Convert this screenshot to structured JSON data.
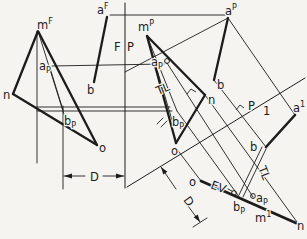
{
  "figure": {
    "background_color": "#f5f4f0",
    "ink_color": "#1c1c1c",
    "labels": [
      {
        "name": "label-a-F",
        "base": "a",
        "sup": "F",
        "x": 97,
        "y": 14,
        "rot": 0
      },
      {
        "name": "label-m-F",
        "base": "m",
        "sup": "F",
        "x": 37,
        "y": 29,
        "rot": 0
      },
      {
        "name": "label-n-front",
        "base": "n",
        "x": 3,
        "y": 99,
        "rot": 0
      },
      {
        "name": "label-a-P-front",
        "base": "a",
        "sub": "P",
        "x": 39,
        "y": 70,
        "rot": 0
      },
      {
        "name": "label-b-front",
        "base": "b",
        "x": 87,
        "y": 94,
        "rot": 0
      },
      {
        "name": "label-b-P-front",
        "base": "b",
        "sub": "P",
        "x": 64,
        "y": 125,
        "rot": 0
      },
      {
        "name": "label-o-front",
        "base": "o",
        "x": 99,
        "y": 152,
        "rot": 0
      },
      {
        "name": "label-D-front",
        "base": "D",
        "x": 90,
        "y": 181,
        "rot": 0
      },
      {
        "name": "label-fold-F",
        "base": "F",
        "x": 114,
        "y": 51,
        "rot": 0
      },
      {
        "name": "label-fold-P",
        "base": "P",
        "x": 127,
        "y": 51,
        "rot": 0
      },
      {
        "name": "label-m-P",
        "base": "m",
        "sup": "P",
        "x": 138,
        "y": 31,
        "rot": 0
      },
      {
        "name": "label-a-P-top",
        "base": "a",
        "sup": "P",
        "x": 225,
        "y": 15,
        "rot": 0
      },
      {
        "name": "label-b-profile",
        "base": "b",
        "x": 217,
        "y": 89,
        "rot": 0
      },
      {
        "name": "label-n-profile",
        "base": "n",
        "x": 208,
        "y": 104,
        "rot": 0
      },
      {
        "name": "label-o-profile",
        "base": "o",
        "x": 171,
        "y": 155,
        "rot": 0
      },
      {
        "name": "label-b-P-profile",
        "base": "b",
        "sub": "P",
        "x": 172,
        "y": 126,
        "rot": 0
      },
      {
        "name": "label-a-P-profile",
        "base": "a",
        "sub": "P",
        "x": 151,
        "y": 66,
        "rot": 0
      },
      {
        "name": "label-TL-profile",
        "base": "TL",
        "x": 158,
        "y": 95,
        "rot": -22
      },
      {
        "name": "label-fold-P2",
        "base": "P",
        "x": 248,
        "y": 110,
        "rot": 0
      },
      {
        "name": "label-fold-1",
        "base": "1",
        "x": 263,
        "y": 115,
        "rot": 0
      },
      {
        "name": "label-a-1",
        "base": "a",
        "sup": "1",
        "x": 293,
        "y": 112,
        "rot": 0
      },
      {
        "name": "label-b-aux",
        "base": "b",
        "x": 250,
        "y": 151,
        "rot": 0
      },
      {
        "name": "label-TL-aux",
        "base": "TL",
        "x": 258,
        "y": 168,
        "rot": 68
      },
      {
        "name": "label-EV",
        "base": "EV",
        "x": 210,
        "y": 188,
        "rot": 21
      },
      {
        "name": "label-o-aux",
        "base": "o",
        "x": 189,
        "y": 186,
        "rot": 0
      },
      {
        "name": "label-b-P-aux",
        "base": "b",
        "sub": "P",
        "x": 233,
        "y": 211,
        "rot": 0
      },
      {
        "name": "label-a-P-aux",
        "base": "a",
        "sub": "P",
        "x": 256,
        "y": 202,
        "rot": 0
      },
      {
        "name": "label-m-1",
        "base": "m",
        "sup": "1",
        "x": 255,
        "y": 222,
        "rot": 0
      },
      {
        "name": "label-n-aux",
        "base": "n",
        "x": 297,
        "y": 230,
        "rot": 0
      },
      {
        "name": "label-D-aux",
        "base": "D",
        "x": 183,
        "y": 200,
        "rot": 55
      }
    ],
    "lines": [
      {
        "name": "edge-mn-front",
        "x1": 38,
        "y1": 31,
        "x2": 13,
        "y2": 94,
        "w": 2.3
      },
      {
        "name": "edge-no-front",
        "x1": 13,
        "y1": 94,
        "x2": 97,
        "y2": 145,
        "w": 2.3
      },
      {
        "name": "edge-mo-front",
        "x1": 38,
        "y1": 31,
        "x2": 97,
        "y2": 145,
        "w": 2.3
      },
      {
        "name": "line-ab-front",
        "x1": 107,
        "y1": 17,
        "x2": 94,
        "y2": 82,
        "w": 2.3
      },
      {
        "name": "edge-mn-profile",
        "x1": 147,
        "y1": 36,
        "x2": 205,
        "y2": 95,
        "w": 2.3
      },
      {
        "name": "edge-no-profile",
        "x1": 205,
        "y1": 95,
        "x2": 176,
        "y2": 143,
        "w": 2.3
      },
      {
        "name": "edge-mo-profile",
        "x1": 147,
        "y1": 36,
        "x2": 176,
        "y2": 143,
        "w": 2.3
      },
      {
        "name": "line-ab-profile",
        "x1": 228,
        "y1": 18,
        "x2": 214,
        "y2": 80,
        "w": 2.3
      },
      {
        "name": "edge-view-line-aux",
        "x1": 201,
        "y1": 181,
        "x2": 296,
        "y2": 223,
        "w": 2.8
      },
      {
        "name": "true-length-line-aux",
        "x1": 295,
        "y1": 115,
        "x2": 266,
        "y2": 147,
        "w": 2.6
      },
      {
        "name": "fold-line-FP",
        "x1": 125,
        "y1": 3,
        "x2": 125,
        "y2": 188,
        "w": 1
      },
      {
        "name": "fold-line-P1",
        "x1": 305,
        "y1": 78,
        "x2": 127,
        "y2": 187,
        "w": 1
      },
      {
        "name": "projector-aF-aP",
        "x1": 110,
        "y1": 15,
        "x2": 226,
        "y2": 15,
        "w": 0.9
      },
      {
        "name": "construction-aP-diagonal",
        "x1": 228,
        "y1": 18,
        "x2": 125,
        "y2": 72,
        "w": 0.9
      },
      {
        "name": "projector-aP-height",
        "x1": 52,
        "y1": 66,
        "x2": 164,
        "y2": 64,
        "w": 0.9
      },
      {
        "name": "projector-bP-height-1",
        "x1": 37,
        "y1": 107,
        "x2": 170,
        "y2": 107,
        "w": 0.9
      },
      {
        "name": "projector-bP-height-2",
        "x1": 37,
        "y1": 111,
        "x2": 172,
        "y2": 111,
        "w": 0.9
      },
      {
        "name": "construction-m-vertical",
        "x1": 37,
        "y1": 31,
        "x2": 37,
        "y2": 163,
        "w": 0.9
      },
      {
        "name": "construction-aP-bP-front",
        "x1": 50,
        "y1": 68,
        "x2": 63,
        "y2": 110,
        "w": 0.9
      },
      {
        "name": "construction-m-bP-front",
        "x1": 38,
        "y1": 31,
        "x2": 67,
        "y2": 124,
        "w": 0.9
      },
      {
        "name": "construction-m-bP-profile",
        "x1": 147,
        "y1": 36,
        "x2": 177,
        "y2": 111,
        "w": 0.9
      },
      {
        "name": "construction-fan-profile",
        "x1": 147,
        "y1": 36,
        "x2": 172,
        "y2": 120,
        "w": 0.9
      },
      {
        "name": "line-ab-aux-ext-1",
        "x1": 266,
        "y1": 149,
        "x2": 243,
        "y2": 197,
        "w": 0.9
      },
      {
        "name": "line-ab-aux-ext-2",
        "x1": 262,
        "y1": 147,
        "x2": 239,
        "y2": 195,
        "w": 0.9
      },
      {
        "name": "projector-aP-a1",
        "x1": 228,
        "y1": 18,
        "x2": 295,
        "y2": 115,
        "w": 0.9
      },
      {
        "name": "projector-b-baux",
        "x1": 214,
        "y1": 80,
        "x2": 266,
        "y2": 147,
        "w": 0.9
      },
      {
        "name": "projector-n-naux",
        "x1": 205,
        "y1": 95,
        "x2": 297,
        "y2": 222,
        "w": 0.9
      },
      {
        "name": "projector-o-oaux",
        "x1": 176,
        "y1": 148,
        "x2": 201,
        "y2": 181,
        "w": 0.9
      },
      {
        "name": "projector-bP-aux",
        "x1": 177,
        "y1": 111,
        "x2": 240,
        "y2": 198,
        "w": 0.9
      },
      {
        "name": "projector-aP-aux",
        "x1": 167,
        "y1": 63,
        "x2": 253,
        "y2": 197,
        "w": 0.9
      },
      {
        "name": "extension-bP-front",
        "x1": 63,
        "y1": 106,
        "x2": 63,
        "y2": 189,
        "w": 0.9
      },
      {
        "name": "dim-D-front-left",
        "x1": 64,
        "y1": 176,
        "x2": 85,
        "y2": 176,
        "w": 0.9
      },
      {
        "name": "dim-D-front-right",
        "x1": 103,
        "y1": 176,
        "x2": 124,
        "y2": 176,
        "w": 0.9
      },
      {
        "name": "dim-D-aux-upper",
        "x1": 161,
        "y1": 167,
        "x2": 176,
        "y2": 189,
        "w": 0.9
      },
      {
        "name": "dim-D-aux-lower",
        "x1": 188,
        "y1": 206,
        "x2": 200,
        "y2": 222,
        "w": 0.9
      },
      {
        "name": "tick-D-aux-end",
        "x1": 193,
        "y1": 227,
        "x2": 207,
        "y2": 218,
        "w": 0.9
      },
      {
        "name": "leader-EV-dash",
        "x1": 228,
        "y1": 189,
        "x2": 232,
        "y2": 191,
        "w": 0.9
      },
      {
        "name": "tick-mark-1",
        "x1": 157,
        "y1": 124,
        "x2": 163,
        "y2": 118,
        "w": 0.9
      },
      {
        "name": "tick-mark-2",
        "x1": 161,
        "y1": 127,
        "x2": 167,
        "y2": 121,
        "w": 0.9
      }
    ],
    "circles": [
      {
        "name": "point-marker-aP-profile",
        "cx": 167,
        "cy": 61,
        "r": 2.4
      },
      {
        "name": "point-marker-EV",
        "cx": 234,
        "cy": 193,
        "r": 2.4
      },
      {
        "name": "point-marker-aP-aux",
        "cx": 253,
        "cy": 196,
        "r": 2.4
      }
    ],
    "polylines": [
      {
        "name": "right-angle-mark-profile",
        "points": "187,94 191,89 196,92"
      },
      {
        "name": "right-angle-mark-fold-P1",
        "points": "236,110 240,105 244,108"
      }
    ],
    "arrows": [
      {
        "name": "arrowhead-D-front-left",
        "points": "64,176 72,173.5 72,178.5"
      },
      {
        "name": "arrowhead-D-front-right",
        "points": "124,176 116,173.5 116,178.5"
      },
      {
        "name": "arrowhead-D-aux-upper",
        "points": "161,167 167.4,171.8 163.3,174.6"
      },
      {
        "name": "arrowhead-D-aux-lower",
        "points": "200,222 197.8,214.4 193.7,217.2"
      }
    ]
  }
}
